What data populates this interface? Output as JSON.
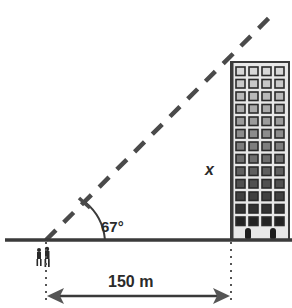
{
  "figure": {
    "type": "right-triangle angle-of-elevation diagram",
    "angle_label": "67°",
    "height_label": "x",
    "distance_label": "150 m",
    "colors": {
      "line": "#3a3a3a",
      "building_fill": "#e6e6e6",
      "window_light": "#d0d0d0",
      "window_dark": "#2e2e2e",
      "background": "#ffffff"
    }
  }
}
